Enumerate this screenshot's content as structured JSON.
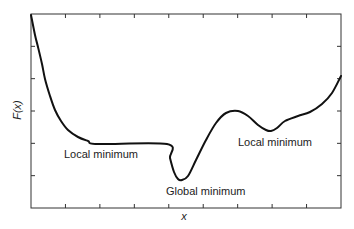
{
  "chart_data": {
    "type": "line",
    "title": "",
    "xlabel": "x",
    "ylabel": "F(x)",
    "grid": false,
    "legend": null,
    "x_tick_count": 8,
    "y_tick_count": 5,
    "tick_labels_shown": false,
    "series": [
      {
        "name": "F(x)",
        "color": "#111111",
        "points_px": [
          [
            31,
            15
          ],
          [
            35,
            35
          ],
          [
            38,
            47
          ],
          [
            42,
            64
          ],
          [
            45,
            79
          ],
          [
            50,
            96
          ],
          [
            55,
            110
          ],
          [
            61,
            121
          ],
          [
            68,
            130
          ],
          [
            78,
            137
          ],
          [
            88,
            141
          ],
          [
            98,
            144
          ],
          [
            167,
            144
          ],
          [
            170,
            158
          ],
          [
            174,
            172
          ],
          [
            178,
            179
          ],
          [
            182,
            180
          ],
          [
            188,
            176
          ],
          [
            196,
            160
          ],
          [
            206,
            140
          ],
          [
            216,
            123
          ],
          [
            226,
            113
          ],
          [
            238,
            111
          ],
          [
            248,
            116
          ],
          [
            258,
            125
          ],
          [
            266,
            130
          ],
          [
            271,
            131
          ],
          [
            277,
            128
          ],
          [
            285,
            121
          ],
          [
            298,
            116
          ],
          [
            310,
            112
          ],
          [
            322,
            104
          ],
          [
            332,
            93
          ],
          [
            341,
            76
          ]
        ]
      }
    ],
    "annotations": [
      {
        "text": "Local minimum",
        "near": "flat plateau (left)"
      },
      {
        "text": "Global minimum",
        "near": "lowest point (center)"
      },
      {
        "text": "Local minimum",
        "near": "dip (right)"
      }
    ]
  },
  "labels": {
    "y_axis": "F(x)",
    "x_axis": "x",
    "local_min_left": "Local minimum",
    "global_min": "Global minimum",
    "local_min_right": "Local minimum"
  }
}
